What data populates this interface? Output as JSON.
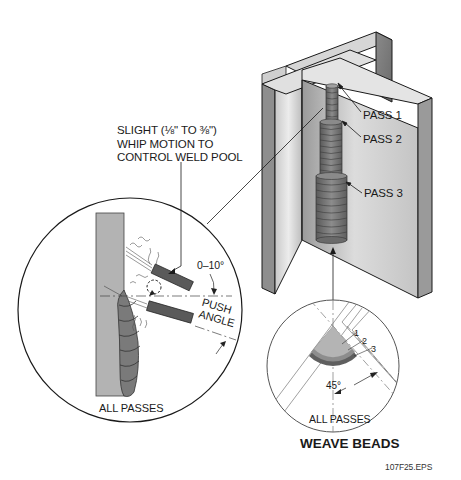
{
  "figure": {
    "title": "WEAVE BEADS",
    "file_id": "107F25.EPS"
  },
  "left_detail": {
    "callout": [
      "SLIGHT (⅛\" TO ⅜\")",
      "WHIP MOTION TO",
      "CONTROL WELD POOL"
    ],
    "angle_label": "0–10°",
    "push_angle_label": [
      "PUSH",
      "ANGLE"
    ],
    "caption": "ALL PASSES"
  },
  "joint_view": {
    "passes": [
      "PASS 1",
      "PASS 2",
      "PASS 3"
    ]
  },
  "right_detail": {
    "pass_numbers": [
      "1",
      "2",
      "3"
    ],
    "angle_label": "45°",
    "caption": "ALL PASSES"
  },
  "colors": {
    "plate_light": "#e2e2e2",
    "plate_mid": "#b8b8b8",
    "plate_dark": "#7a7a7a",
    "weld": "#6f6f6f",
    "outline": "#1a1a1a",
    "electrode": "#555555"
  }
}
